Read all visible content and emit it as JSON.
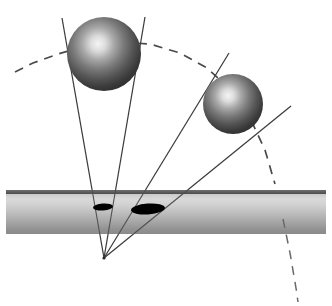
{
  "figure": {
    "canvas": {
      "width": 332,
      "height": 306,
      "background": "#ffffff"
    },
    "colors": {
      "background": "#ffffff",
      "sphere_dark": "#2b2b2b",
      "sphere_mid": "#6e6e6e",
      "sphere_highlight": "#f2f2f2",
      "pipe_light": "#d8d8d8",
      "pipe_mid": "#b3b3b3",
      "pipe_dark": "#8a8a8a",
      "pipe_edge": "#4a4a4a",
      "hole_fill": "#000000",
      "ray_line": "#3c3c3c",
      "dashed_arc": "#4a4a4a"
    },
    "spheres": [
      {
        "name": "sphere-large-left",
        "cx": 104,
        "cy": 54,
        "r": 37,
        "highlight_cx": 98,
        "highlight_cy": 46,
        "label": "left sphere"
      },
      {
        "name": "sphere-small-right",
        "cx": 233,
        "cy": 104,
        "r": 30,
        "highlight_cx": 228,
        "highlight_cy": 97,
        "label": "right sphere"
      }
    ],
    "pipe": {
      "name": "horizontal-pipe",
      "x": 6,
      "y": 190,
      "width": 320,
      "height": 44,
      "top_edge_thickness": 4,
      "label": "cylindrical pipe"
    },
    "holes": [
      {
        "name": "hole-small",
        "cx": 103,
        "cy": 207,
        "rx": 10,
        "ry": 3.5,
        "rotation": -4,
        "label": "small elliptical aperture"
      },
      {
        "name": "hole-large",
        "cx": 148,
        "cy": 209,
        "rx": 17,
        "ry": 5.5,
        "rotation": -4,
        "label": "large elliptical aperture"
      }
    ],
    "apex": {
      "name": "ray-convergence-point",
      "x": 104,
      "y": 258,
      "label": "convergence point"
    },
    "rays": [
      {
        "name": "ray-1",
        "x1": 62,
        "y1": 18,
        "x2": 104,
        "y2": 258
      },
      {
        "name": "ray-2",
        "x1": 145,
        "y1": 17,
        "x2": 104,
        "y2": 258
      },
      {
        "name": "ray-3",
        "x1": 229,
        "y1": 53,
        "x2": 104,
        "y2": 258
      },
      {
        "name": "ray-4",
        "x1": 291,
        "y1": 106,
        "x2": 104,
        "y2": 258
      }
    ],
    "dashed_arc": {
      "name": "dashed-trajectory-arc",
      "dash_pattern": "9 7",
      "points": "15,72 33,63 58,54 86,46 118,42 150,44 180,53 207,68 231,90 250,118 265,150 275,184 283,219 290,253 296,288 298,302"
    }
  }
}
